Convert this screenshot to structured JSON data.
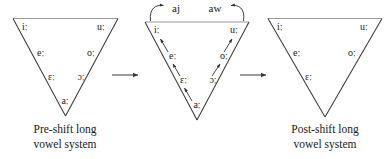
{
  "figure": {
    "background_color": "#ffffff",
    "ink_color": "#1a1a1a",
    "top_edge_color": "#9a9a9a",
    "side_edge_color": "#3a3a3a"
  },
  "panels": [
    {
      "id": "pre-shift",
      "caption_line1": "Pre-shift long",
      "caption_line2": "vowel system",
      "vowels": [
        {
          "symbol": "iː",
          "position": "high-front"
        },
        {
          "symbol": "uː",
          "position": "high-back"
        },
        {
          "symbol": "eː",
          "position": "upper-mid-front"
        },
        {
          "symbol": "oː",
          "position": "upper-mid-back"
        },
        {
          "symbol": "ɛː",
          "position": "lower-mid-front"
        },
        {
          "symbol": "ɔː",
          "position": "lower-mid-back"
        },
        {
          "symbol": "aː",
          "position": "low-central"
        }
      ]
    },
    {
      "id": "shift-in-progress",
      "caption_line1": "",
      "caption_line2": "",
      "vowels": [
        {
          "symbol": "iː",
          "position": "high-front"
        },
        {
          "symbol": "uː",
          "position": "high-back"
        },
        {
          "symbol": "eː",
          "position": "upper-mid-front"
        },
        {
          "symbol": "oː",
          "position": "upper-mid-back"
        },
        {
          "symbol": "ɛː",
          "position": "lower-mid-front"
        },
        {
          "symbol": "ɔː",
          "position": "lower-mid-back"
        },
        {
          "symbol": "aː",
          "position": "low-central"
        }
      ],
      "diphthong_outputs": [
        {
          "symbol": "aj",
          "from": "iː"
        },
        {
          "symbol": "aw",
          "from": "uː"
        }
      ],
      "raising_shifts": [
        {
          "from": "aː",
          "to": "ɛː"
        },
        {
          "from": "ɛː",
          "to": "eː"
        },
        {
          "from": "eː",
          "to": "iː"
        },
        {
          "from": "ɔː",
          "to": "oː"
        },
        {
          "from": "oː",
          "to": "uː"
        }
      ]
    },
    {
      "id": "post-shift",
      "caption_line1": "Post-shift long",
      "caption_line2": "vowel system",
      "vowels": [
        {
          "symbol": "iː",
          "position": "high-front"
        },
        {
          "symbol": "uː",
          "position": "high-back"
        },
        {
          "symbol": "eː",
          "position": "upper-mid-front"
        },
        {
          "symbol": "oː",
          "position": "upper-mid-back"
        },
        {
          "symbol": "ɛː",
          "position": "lower-mid-front"
        }
      ]
    }
  ],
  "stage_arrows": [
    {
      "id": "arrow-1",
      "from_panel": "pre-shift",
      "to_panel": "shift-in-progress"
    },
    {
      "id": "arrow-2",
      "from_panel": "shift-in-progress",
      "to_panel": "post-shift"
    }
  ]
}
